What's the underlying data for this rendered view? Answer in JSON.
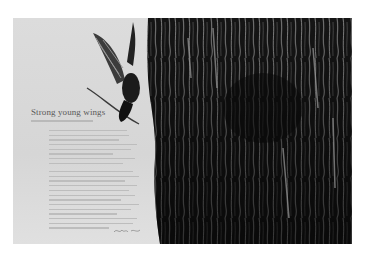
{
  "spread": {
    "title": "Strong young wings",
    "photo": {
      "subject": "bird-in-flight-near-tree-trunk",
      "tone": "black-and-white"
    },
    "colors": {
      "page": "#ffffff",
      "sky": "#d9d9d9",
      "bark_dark": "#111111",
      "bark_light": "#8a8a8a",
      "title_text": "#5a5a5a",
      "body_text": "#bdbdbd"
    },
    "body_paragraphs": [
      {
        "line_widths": [
          78,
          80,
          70,
          88,
          82,
          64,
          86,
          74
        ]
      },
      {
        "line_widths": [
          84,
          90,
          76,
          88,
          80,
          86,
          72,
          90,
          82,
          68,
          88,
          84,
          60
        ]
      }
    ]
  }
}
